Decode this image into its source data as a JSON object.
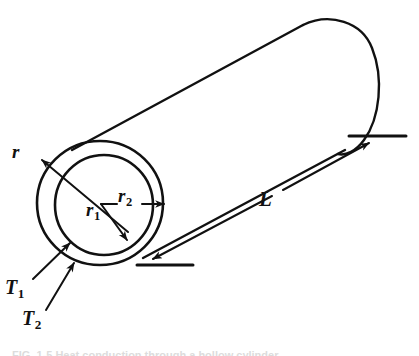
{
  "figure": {
    "kind": "engineering-line-drawing",
    "background_color": "#ffffff",
    "ink_color": "#111111",
    "width": 419,
    "height": 356
  },
  "labels": {
    "radial_direction": "r",
    "inner_radius": "r",
    "inner_radius_sub": "1",
    "outer_radius": "r",
    "outer_radius_sub": "2",
    "length": "L",
    "inner_temperature": "T",
    "inner_temperature_sub": "1",
    "outer_temperature": "T",
    "outer_temperature_sub": "2"
  },
  "caption": {
    "text": "FIG. 1-5   Heat conduction through a hollow cylinder."
  },
  "geometry": {
    "outer_ring": {
      "cx": 100,
      "cy": 203,
      "rx": 63,
      "ry": 62
    },
    "inner_ring": {
      "cx": 104,
      "cy": 205,
      "rx": 49,
      "ry": 50
    },
    "radii_origin": {
      "x": 101,
      "y": 204
    },
    "cylinder_axis_angle_deg": -28,
    "length_dimension": {
      "from": {
        "x": 152,
        "y": 258
      },
      "to": {
        "x": 367,
        "y": 143
      }
    }
  }
}
